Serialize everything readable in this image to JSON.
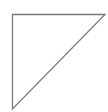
{
  "canvas": {
    "width": 108,
    "height": 112,
    "background": "#ffffff"
  },
  "shape": {
    "type": "right-triangle",
    "points": "12.5,14.5 105,14.5 12.5,109",
    "stroke": "#7a7a7a",
    "stroke_width": 1.3,
    "fill": "none"
  }
}
